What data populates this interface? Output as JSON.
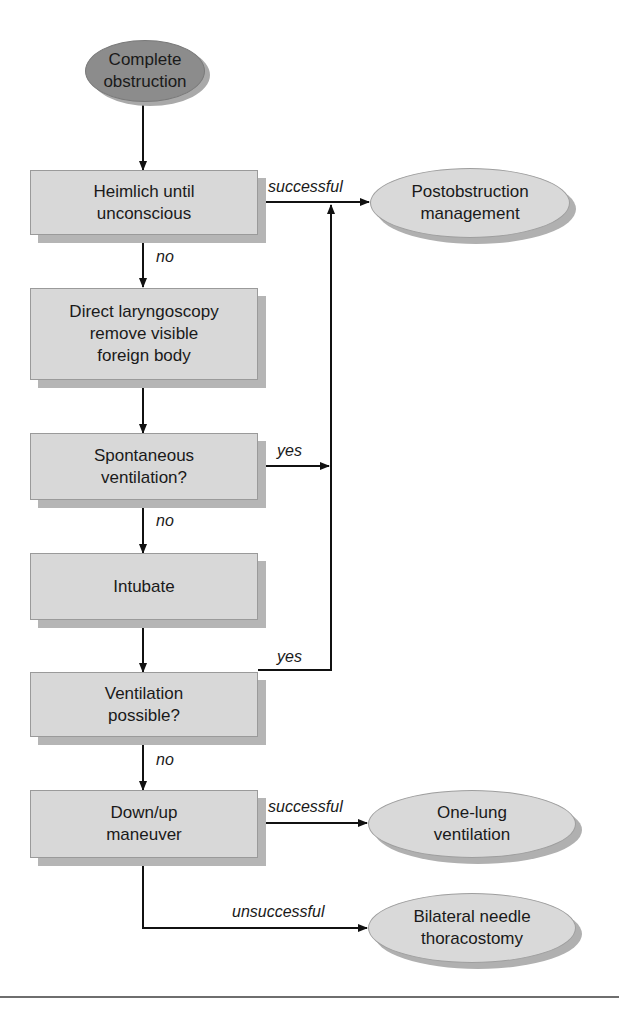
{
  "diagram": {
    "nodes": {
      "start": {
        "label": "Complete\nobstruction",
        "shape": "oval",
        "fill": "#8c8c8c"
      },
      "heimlich": {
        "label": "Heimlich until\nunconscious",
        "shape": "box"
      },
      "laryngoscopy": {
        "label": "Direct laryngoscopy\nremove visible\nforeign body",
        "shape": "box"
      },
      "spontaneous": {
        "label": "Spontaneous\nventilation?",
        "shape": "box"
      },
      "intubate": {
        "label": "Intubate",
        "shape": "box"
      },
      "ventilation_possible": {
        "label": "Ventilation\npossible?",
        "shape": "box"
      },
      "down_up": {
        "label": "Down/up\nmaneuver",
        "shape": "box"
      },
      "postobstruction": {
        "label": "Postobstruction\nmanagement",
        "shape": "oval",
        "fill": "#d9d9d9"
      },
      "one_lung": {
        "label": "One-lung\nventilation",
        "shape": "oval",
        "fill": "#d9d9d9"
      },
      "thoracostomy": {
        "label": "Bilateral needle\nthoracostomy",
        "shape": "oval",
        "fill": "#d9d9d9"
      }
    },
    "edge_labels": {
      "heimlich_success": "successful",
      "heimlich_no": "no",
      "spontaneous_yes": "yes",
      "spontaneous_no": "no",
      "ventilation_yes": "yes",
      "ventilation_no": "no",
      "downup_success": "successful",
      "downup_fail": "unsuccessful"
    },
    "edges": [
      {
        "from": "start",
        "to": "heimlich",
        "label": ""
      },
      {
        "from": "heimlich",
        "to": "postobstruction",
        "label": "successful"
      },
      {
        "from": "heimlich",
        "to": "laryngoscopy",
        "label": "no"
      },
      {
        "from": "laryngoscopy",
        "to": "spontaneous",
        "label": ""
      },
      {
        "from": "spontaneous",
        "to": "postobstruction",
        "label": "yes"
      },
      {
        "from": "spontaneous",
        "to": "intubate",
        "label": "no"
      },
      {
        "from": "intubate",
        "to": "ventilation_possible",
        "label": ""
      },
      {
        "from": "ventilation_possible",
        "to": "postobstruction",
        "label": "yes"
      },
      {
        "from": "ventilation_possible",
        "to": "down_up",
        "label": "no"
      },
      {
        "from": "down_up",
        "to": "one_lung",
        "label": "successful"
      },
      {
        "from": "down_up",
        "to": "thoracostomy",
        "label": "unsuccessful"
      }
    ]
  }
}
